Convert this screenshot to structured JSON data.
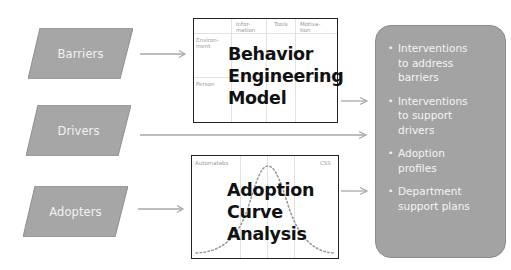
{
  "inputs": [
    {
      "label": "Barriers"
    },
    {
      "label": "Drivers"
    },
    {
      "label": "Adopters"
    }
  ],
  "behavior_model": {
    "title_line1": "Behavior",
    "title_line2": "Engineering",
    "title_line3": "Model",
    "column_headers": [
      "Infor-\nmation",
      "Tools",
      "Motiva-\ntion"
    ],
    "col_header_1": "Infor-",
    "col_header_1b": "mation",
    "col_header_2": "Tools",
    "col_header_3": "Motiva-",
    "col_header_3b": "tion",
    "row_header_1": "Environ-",
    "row_header_1b": "ment",
    "row_header_2": "Person"
  },
  "adoption_curve": {
    "title_line1": "Adoption",
    "title_line2": "Curve",
    "title_line3": "Analysis",
    "left_label": "Automatabs",
    "right_label": "CSS"
  },
  "outputs": {
    "items": [
      {
        "line1": "Interventions",
        "line2": "to address",
        "line3": "barriers"
      },
      {
        "line1": "Interventions",
        "line2": "to support",
        "line3": "drivers"
      },
      {
        "line1": "Adoption",
        "line2": "profiles",
        "line3": ""
      },
      {
        "line1": "Department",
        "line2": "support plans",
        "line3": ""
      }
    ],
    "bullet": "•"
  },
  "colors": {
    "shape_fill": "#a6a6a6",
    "output_fill": "#a3a3a3",
    "arrow": "#a9a9a9",
    "box_border": "#222222",
    "curve_dots": "#9a9a9a"
  }
}
